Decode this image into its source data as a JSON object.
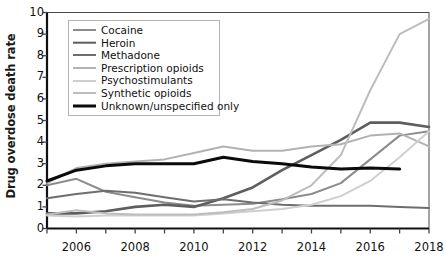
{
  "chart_data": {
    "type": "line",
    "title": "",
    "xlabel": "",
    "ylabel": "Drug overdose death rate",
    "xlim": [
      2005,
      2018
    ],
    "ylim": [
      0,
      10
    ],
    "grid": false,
    "legend_position": "upper-left",
    "x_tick_labels": [
      "2006",
      "2008",
      "2010",
      "2012",
      "2014",
      "2016",
      "2018"
    ],
    "x_tick_values": [
      2006,
      2008,
      2010,
      2012,
      2014,
      2016,
      2018
    ],
    "x_minor_tick_values": [
      2005,
      2007,
      2009,
      2011,
      2013,
      2015,
      2017
    ],
    "y_tick_labels": [
      "0",
      "1",
      "2",
      "3",
      "4",
      "5",
      "6",
      "7",
      "8",
      "9",
      "10"
    ],
    "y_tick_values": [
      0,
      1,
      2,
      3,
      4,
      5,
      6,
      7,
      8,
      9,
      10
    ],
    "x": [
      2005,
      2006,
      2007,
      2008,
      2009,
      2010,
      2011,
      2012,
      2013,
      2014,
      2015,
      2016,
      2017,
      2018
    ],
    "series": [
      {
        "name": "Cocaine",
        "color": "#8c8c8c",
        "width": 2.0,
        "values": [
          2.0,
          2.3,
          1.7,
          1.45,
          1.2,
          1.05,
          1.1,
          1.15,
          1.35,
          1.6,
          2.1,
          3.2,
          4.3,
          4.5
        ]
      },
      {
        "name": "Heroin",
        "color": "#5e5e5e",
        "width": 2.6,
        "values": [
          0.7,
          0.7,
          0.8,
          1.0,
          1.1,
          1.0,
          1.4,
          1.9,
          2.7,
          3.4,
          4.1,
          4.9,
          4.9,
          4.7
        ]
      },
      {
        "name": "Methadone",
        "color": "#6e6e6e",
        "width": 2.0,
        "values": [
          1.4,
          1.6,
          1.75,
          1.65,
          1.45,
          1.25,
          1.35,
          1.2,
          1.1,
          1.05,
          1.05,
          1.05,
          1.0,
          0.95
        ]
      },
      {
        "name": "Prescription opioids",
        "color": "#b2b2b2",
        "width": 2.0,
        "values": [
          2.1,
          2.8,
          3.0,
          3.1,
          3.2,
          3.5,
          3.8,
          3.6,
          3.6,
          3.8,
          3.9,
          4.3,
          4.4,
          3.8
        ]
      },
      {
        "name": "Psychostimulants",
        "color": "#cfcfcf",
        "width": 2.0,
        "values": [
          0.6,
          0.55,
          0.6,
          0.6,
          0.6,
          0.6,
          0.7,
          0.8,
          0.9,
          1.1,
          1.5,
          2.2,
          3.3,
          4.5
        ]
      },
      {
        "name": "Synthetic opioids",
        "color": "#bdbdbd",
        "width": 2.0,
        "values": [
          0.65,
          0.85,
          0.7,
          0.65,
          0.65,
          0.65,
          0.75,
          0.9,
          1.3,
          2.0,
          3.4,
          6.4,
          9.0,
          9.7
        ]
      },
      {
        "name": "Unknown/unspecified only",
        "color": "#0b0b0b",
        "width": 3.0,
        "values": [
          2.2,
          2.7,
          2.9,
          3.0,
          3.0,
          3.0,
          3.3,
          3.1,
          3.0,
          2.85,
          2.75,
          2.8,
          2.75,
          null
        ]
      }
    ]
  },
  "axes": {
    "y_axis_title": "Drug overdose death rate"
  },
  "legend": {
    "items": [
      {
        "label": "Cocaine"
      },
      {
        "label": "Heroin"
      },
      {
        "label": "Methadone"
      },
      {
        "label": "Prescription opioids"
      },
      {
        "label": "Psychostimulants"
      },
      {
        "label": "Synthetic opioids"
      },
      {
        "label": "Unknown/unspecified only"
      }
    ]
  }
}
